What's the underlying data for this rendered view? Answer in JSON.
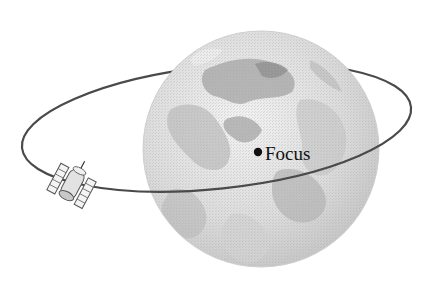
{
  "diagram": {
    "type": "orbit-illustration",
    "labels": {
      "focus": "Focus"
    },
    "elements": {
      "earth": {
        "shape": "sphere",
        "center": [
          261,
          149
        ],
        "radius": 118
      },
      "orbit": {
        "shape": "ellipse",
        "center": [
          216,
          143
        ],
        "rx": 195,
        "ry": 61,
        "rotation_deg": -6
      },
      "focus_point": {
        "position": [
          258,
          152
        ]
      },
      "satellite": {
        "position": [
          68,
          185
        ]
      }
    },
    "colors": {
      "background": "#ffffff",
      "orbit_line": "#4a4a4a",
      "earth_light": "#e6e6e6",
      "earth_mid": "#c4c4c4",
      "earth_dark": "#9c9c9c",
      "focus_dot": "#111111",
      "label_text": "#111111"
    }
  }
}
